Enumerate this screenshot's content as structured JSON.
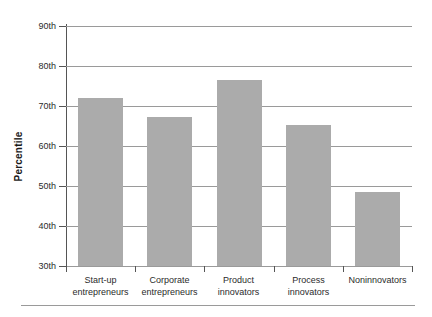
{
  "chart_data": {
    "type": "bar",
    "title": "",
    "subtitle": "",
    "xlabel": "",
    "ylabel": "Percentile",
    "ylim": [
      30,
      90
    ],
    "ytick_values": [
      90,
      80,
      70,
      60,
      50,
      40,
      30
    ],
    "ytick_labels": [
      "90th",
      "80th",
      "70th",
      "60th",
      "50th",
      "40th",
      "30th"
    ],
    "grid": "horizontal",
    "legend": null,
    "legend_position": "none",
    "bar_color": "#ababab",
    "axis_color": "#555555",
    "grid_color": "#9a9a9a",
    "categories": [
      "Start-up entrepreneurs",
      "Corporate entrepreneurs",
      "Product innovators",
      "Process innovators",
      "Noninnovators"
    ],
    "category_lines": [
      [
        "Start-up",
        "entrepreneurs"
      ],
      [
        "Corporate",
        "entrepreneurs"
      ],
      [
        "Product",
        "innovators"
      ],
      [
        "Process",
        "innovators"
      ],
      [
        "Noninnovators",
        ""
      ]
    ],
    "values": [
      72,
      67.3,
      76.5,
      65.3,
      48.5
    ]
  }
}
